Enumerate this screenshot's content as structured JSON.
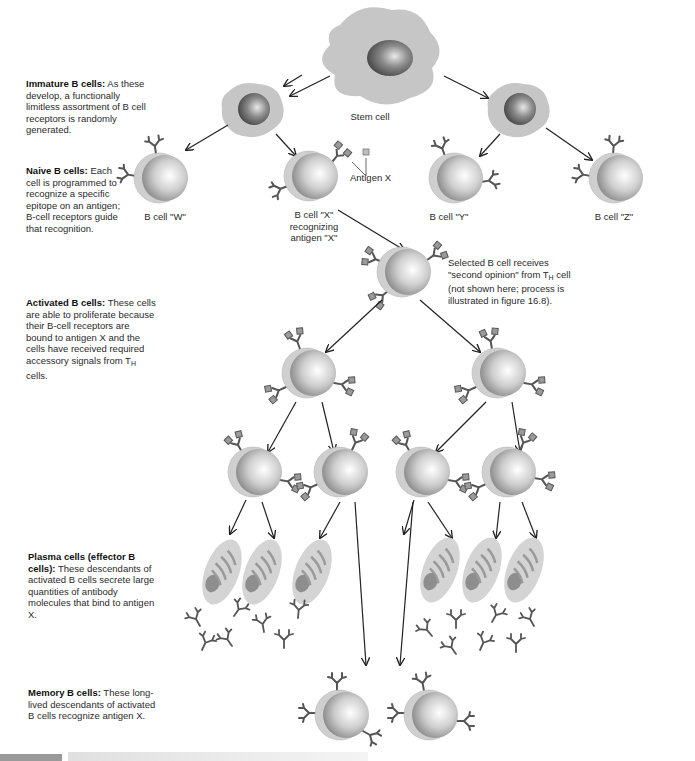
{
  "figure": {
    "descriptions": [
      {
        "id": "immature",
        "title": "Immature B cells:",
        "text": "As these develop, a functionally limitless assortment of B cell receptors is randomly generated."
      },
      {
        "id": "naive",
        "title": "Naive B cells:",
        "text": "Each cell is programmed to recognize a specific epitope on an antigen; B-cell receptors guide that recognition."
      },
      {
        "id": "activated",
        "title": "Activated B cells:",
        "text": "These cells are able to proliferate because their B-cell receptors are bound to antigen X and the cells have received required accessory signals from T",
        "sub": "H",
        "text_after": " cells."
      },
      {
        "id": "plasma",
        "title": "Plasma cells (effector B cells):",
        "text": "These descendants of activated B cells secrete large quantities of antibody molecules that bind to antigen X."
      },
      {
        "id": "memory",
        "title": "Memory B cells:",
        "text": "These long-lived descendants of activated B cells recognize antigen X."
      }
    ],
    "labels": {
      "stem_cell": "Stem cell",
      "antigen_x": "Antigen X",
      "cell_w": "B cell \"W\"",
      "cell_x_line1": "B cell \"X\"",
      "cell_x_line2": "recognizing",
      "cell_x_line3": "antigen \"X\"",
      "cell_y": "B cell \"Y\"",
      "cell_z": "B cell \"Z\""
    },
    "note": {
      "line1": "Selected B cell receives",
      "line2a": "\"second opinion\" from T",
      "line2sub": "H",
      "line2b": " cell",
      "line3": "(not shown here; process is",
      "line4": "illustrated in figure 16.8)."
    },
    "colors": {
      "membrane": "#c9c9c9",
      "nucleus_dark": "#6a6a6a",
      "cell_light": "#f4f4f4",
      "receptor": "#555555",
      "antigen": "#9a9a9a",
      "arrow": "#222222"
    }
  }
}
